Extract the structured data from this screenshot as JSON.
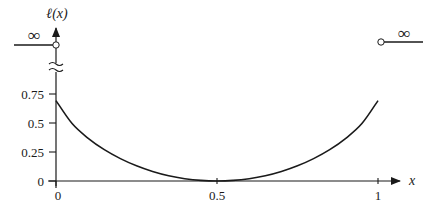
{
  "chart_data": {
    "type": "line",
    "title": "",
    "xlabel": "x",
    "ylabel": "ℓ(x)",
    "x_ticks": [
      "0",
      "0.5",
      "1"
    ],
    "x_tick_values": [
      0,
      0.5,
      1
    ],
    "y_ticks": [
      "0",
      "0.25",
      "0.5",
      "0.75"
    ],
    "y_tick_values": [
      0,
      0.25,
      0.5,
      0.75
    ],
    "xlim": [
      0,
      1
    ],
    "ylim": [
      0,
      0.75
    ],
    "grid": false,
    "legend": null,
    "series": [
      {
        "name": "ℓ(x)",
        "x": [
          0,
          0.05,
          0.1,
          0.15,
          0.2,
          0.25,
          0.3,
          0.35,
          0.4,
          0.45,
          0.5,
          0.55,
          0.6,
          0.65,
          0.7,
          0.75,
          0.8,
          0.85,
          0.9,
          0.95,
          1
        ],
        "y": [
          0.693,
          0.495,
          0.368,
          0.27,
          0.193,
          0.131,
          0.082,
          0.045,
          0.02,
          0.005,
          0.0,
          0.005,
          0.02,
          0.045,
          0.082,
          0.131,
          0.193,
          0.27,
          0.368,
          0.495,
          0.693
        ]
      }
    ],
    "annotations": [
      {
        "text": "∞",
        "position": "left of x=0",
        "meaning": "ℓ(x) = ∞ for x < 0 (open circle at x=0)"
      },
      {
        "text": "∞",
        "position": "right of x=1",
        "meaning": "ℓ(x) = ∞ for x > 1 (open circle at x=1)"
      },
      {
        "text": "≈",
        "position": "y-axis break between 0.75 and ∞"
      }
    ]
  },
  "labels": {
    "ylabel": "ℓ(x)",
    "xlabel": "x",
    "inf_left": "∞",
    "inf_right": "∞",
    "x_tick_0": "0",
    "x_tick_05": "0.5",
    "x_tick_1": "1",
    "y_tick_0": "0",
    "y_tick_025": "0.25",
    "y_tick_05": "0.5",
    "y_tick_075": "0.75"
  },
  "colors": {
    "ink": "#1a1a1a",
    "background": "#ffffff"
  }
}
